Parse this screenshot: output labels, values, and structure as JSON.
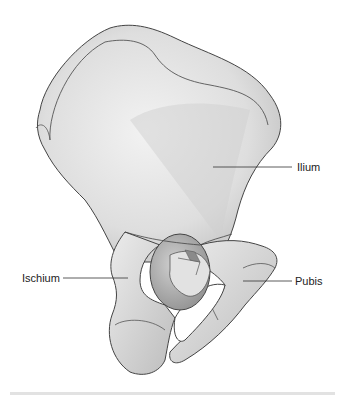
{
  "diagram": {
    "labels": [
      {
        "id": "ilium",
        "text": "Ilium",
        "x": 297,
        "y": 161,
        "line": [
          213,
          167,
          292,
          167
        ]
      },
      {
        "id": "ischium",
        "text": "Ischium",
        "x": 22,
        "y": 272,
        "line": [
          63,
          278,
          128,
          278
        ]
      },
      {
        "id": "pubis",
        "text": "Pubis",
        "x": 295,
        "y": 275,
        "line": [
          243,
          281,
          292,
          281
        ]
      }
    ],
    "colors": {
      "bone_fill": "#e6e6e6",
      "bone_shadow": "#b5b5b5",
      "outline": "#444444",
      "label_text": "#222222",
      "background": "#ffffff"
    }
  }
}
